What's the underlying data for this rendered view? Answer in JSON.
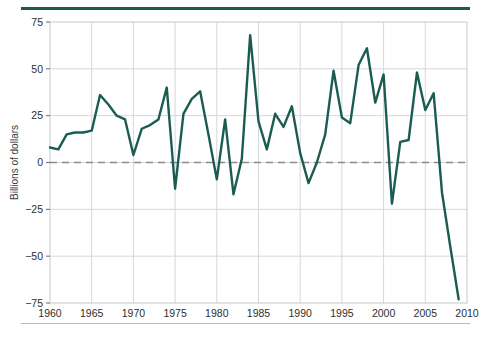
{
  "figure": {
    "accent_color": "#1a5c52",
    "rule_bottom_color": "#b9bfbd",
    "background": "#ffffff"
  },
  "chart_data": {
    "type": "line",
    "title": "",
    "subtitle": "",
    "xlabel": "",
    "ylabel": "Billions of dollars",
    "xlim": [
      1960,
      2010
    ],
    "ylim": [
      -75,
      75
    ],
    "grid": true,
    "legend": false,
    "legend_position": "none",
    "zero_line": {
      "value": 0,
      "style": "dashed",
      "color": "#8a8a8a"
    },
    "line_color": "#1a5c52",
    "line_width": 2.4,
    "xticks": [
      1960,
      1965,
      1970,
      1975,
      1980,
      1985,
      1990,
      1995,
      2000,
      2005,
      2010
    ],
    "xtick_labels": [
      "1960",
      "1965",
      "1970",
      "1975",
      "1980",
      "1985",
      "1990",
      "1995",
      "2000",
      "2005",
      "2010"
    ],
    "yticks": [
      -75,
      -50,
      -25,
      0,
      25,
      50,
      75
    ],
    "ytick_labels": [
      "−75",
      "−50",
      "−25",
      "0",
      "25",
      "50",
      "75"
    ],
    "x": [
      1960,
      1961,
      1962,
      1963,
      1964,
      1965,
      1966,
      1967,
      1968,
      1969,
      1970,
      1971,
      1972,
      1973,
      1974,
      1975,
      1976,
      1977,
      1978,
      1979,
      1980,
      1981,
      1982,
      1983,
      1984,
      1985,
      1986,
      1987,
      1988,
      1989,
      1990,
      1991,
      1992,
      1993,
      1994,
      1995,
      1996,
      1997,
      1998,
      1999,
      2000,
      2001,
      2002,
      2003,
      2004,
      2005,
      2006,
      2007,
      2008,
      2009
    ],
    "values": [
      8,
      7,
      15,
      16,
      16,
      17,
      36,
      31,
      25,
      23,
      4,
      18,
      20,
      23,
      40,
      -14,
      26,
      34,
      38,
      15,
      -9,
      23,
      -17,
      2,
      68,
      22,
      7,
      26,
      19,
      30,
      5,
      -11,
      0,
      15,
      49,
      24,
      21,
      52,
      61,
      32,
      47,
      -22,
      11,
      12,
      48,
      28,
      37,
      -16,
      -45,
      -73
    ],
    "series": [
      {
        "name": "Billions of dollars",
        "color": "#1a5c52",
        "values": [
          8,
          7,
          15,
          16,
          16,
          17,
          36,
          31,
          25,
          23,
          4,
          18,
          20,
          23,
          40,
          -14,
          26,
          34,
          38,
          15,
          -9,
          23,
          -17,
          2,
          68,
          22,
          7,
          26,
          19,
          30,
          5,
          -11,
          0,
          15,
          49,
          24,
          21,
          52,
          61,
          32,
          47,
          -22,
          11,
          12,
          48,
          28,
          37,
          -16,
          -45,
          -73
        ]
      }
    ]
  }
}
